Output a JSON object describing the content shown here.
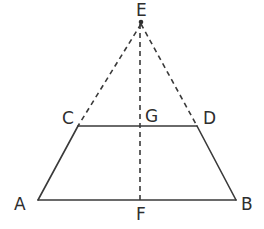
{
  "figure": {
    "kind": "geometry-diagram",
    "shape": "isosceles-trapezoid-with-apex-extension",
    "width": 264,
    "height": 229,
    "background_color": "#ffffff",
    "stroke_color": "#3a3a3a",
    "dash_color": "#3a3a3a",
    "label_color": "#2e2e2e",
    "solid_stroke_width": 1.6,
    "dashed_stroke_width": 1.6,
    "dash_pattern": "5,4"
  },
  "points": [
    {
      "id": "E",
      "label": "E",
      "x": 141,
      "y": 22,
      "label_x": 136,
      "label_y": 2,
      "marked": true
    },
    {
      "id": "C",
      "label": "C",
      "x": 78,
      "y": 126,
      "label_x": 62,
      "label_y": 110,
      "marked": false
    },
    {
      "id": "G",
      "label": "G",
      "x": 140,
      "y": 126,
      "label_x": 145,
      "label_y": 108,
      "marked": false
    },
    {
      "id": "D",
      "label": "D",
      "x": 197,
      "y": 126,
      "label_x": 203,
      "label_y": 110,
      "marked": false
    },
    {
      "id": "A",
      "label": "A",
      "x": 38,
      "y": 200,
      "label_x": 14,
      "label_y": 196,
      "marked": false
    },
    {
      "id": "F",
      "label": "F",
      "x": 140,
      "y": 200,
      "label_x": 136,
      "label_y": 206,
      "marked": false
    },
    {
      "id": "B",
      "label": "B",
      "x": 236,
      "y": 200,
      "label_x": 241,
      "label_y": 196,
      "marked": false
    }
  ],
  "segments": {
    "solid": [
      {
        "id": "seg-AC",
        "from": "A",
        "to": "C",
        "x1": 38,
        "y1": 200,
        "x2": 78,
        "y2": 126
      },
      {
        "id": "seg-CD",
        "from": "C",
        "to": "D",
        "x1": 78,
        "y1": 126,
        "x2": 197,
        "y2": 126
      },
      {
        "id": "seg-DB",
        "from": "D",
        "to": "B",
        "x1": 197,
        "y1": 126,
        "x2": 236,
        "y2": 200
      },
      {
        "id": "seg-AB",
        "from": "A",
        "to": "B",
        "x1": 38,
        "y1": 200,
        "x2": 236,
        "y2": 200
      }
    ],
    "dashed": [
      {
        "id": "seg-EC",
        "from": "E",
        "to": "C",
        "x1": 141,
        "y1": 24,
        "x2": 78,
        "y2": 126
      },
      {
        "id": "seg-ED",
        "from": "E",
        "to": "D",
        "x1": 141,
        "y1": 24,
        "x2": 197,
        "y2": 126
      },
      {
        "id": "seg-EF",
        "from": "E",
        "to": "F",
        "x1": 140,
        "y1": 24,
        "x2": 140,
        "y2": 202
      }
    ]
  }
}
